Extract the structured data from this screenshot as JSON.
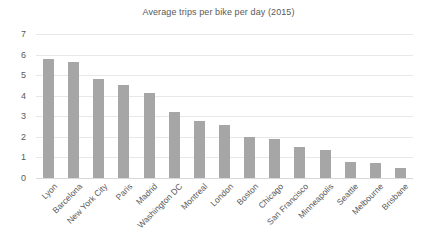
{
  "chart_data": {
    "type": "bar",
    "title": "Average trips per bike per day (2015)",
    "xlabel": "",
    "ylabel": "",
    "ylim": [
      0,
      7
    ],
    "yticks": [
      0,
      1,
      2,
      3,
      4,
      5,
      6,
      7
    ],
    "grid": true,
    "legend": false,
    "bar_color": "#a6a6a6",
    "gridline_color": "#e8e8e8",
    "text_color": "#595959",
    "categories": [
      "Lyon",
      "Barcelona",
      "New York City",
      "Paris",
      "Madrid",
      "Washington DC",
      "Montreal",
      "London",
      "Boston",
      "Chicago",
      "San Francisco",
      "Minneapolis",
      "Seattle",
      "Melbourne",
      "Brisbane"
    ],
    "values": [
      5.8,
      5.65,
      4.8,
      4.5,
      4.15,
      3.2,
      2.75,
      2.6,
      2.0,
      1.9,
      1.5,
      1.35,
      0.8,
      0.75,
      0.5
    ]
  }
}
